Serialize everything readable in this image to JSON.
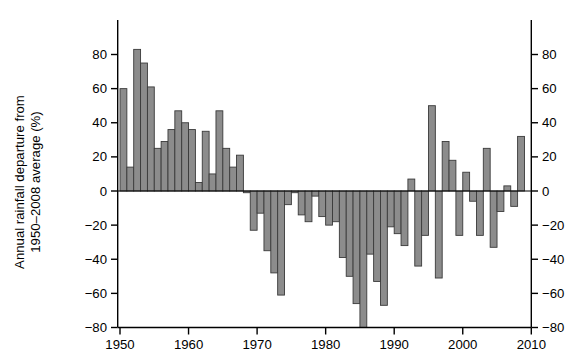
{
  "chart_data": {
    "type": "bar",
    "title": "",
    "xlabel": "",
    "ylabel": "Annual rainfall departure from\n1950–2008 average (%)",
    "ylim": [
      -80,
      90
    ],
    "xlim": [
      1949,
      2011
    ],
    "grid": false,
    "legend": null,
    "y_ticks": [
      80,
      60,
      40,
      20,
      0,
      -20,
      -40,
      -60,
      -80
    ],
    "y_tick_labels": [
      "80",
      "60",
      "40",
      "20",
      "0",
      "−20",
      "−40",
      "−60",
      "−80"
    ],
    "y_ticks_right": [
      80,
      60,
      40,
      20,
      0,
      -20,
      -40,
      -60,
      -80
    ],
    "y_tick_labels_right": [
      "80",
      "60",
      "40",
      "20",
      "0",
      "−20",
      "−40",
      "−60",
      "−80"
    ],
    "x_ticks": [
      1950,
      1960,
      1970,
      1980,
      1990,
      2000,
      2010
    ],
    "x_tick_labels": [
      "1950",
      "1960",
      "1970",
      "1980",
      "1990",
      "2000",
      "2010"
    ],
    "bar_color": "#8c8c8c",
    "bar_edge_color": "#3a3a3a",
    "axis_color": "#000000",
    "categories": [
      1950,
      1951,
      1952,
      1953,
      1954,
      1955,
      1956,
      1957,
      1958,
      1959,
      1960,
      1961,
      1962,
      1963,
      1964,
      1965,
      1966,
      1967,
      1968,
      1969,
      1970,
      1971,
      1972,
      1973,
      1974,
      1975,
      1976,
      1977,
      1978,
      1979,
      1980,
      1981,
      1982,
      1983,
      1984,
      1985,
      1986,
      1987,
      1988,
      1989,
      1990,
      1991,
      1992,
      1993,
      1994,
      1995,
      1996,
      1997,
      1998,
      1999,
      2000,
      2001,
      2002,
      2003,
      2004,
      2005,
      2006,
      2007,
      2008
    ],
    "values": [
      60,
      14,
      83,
      75,
      61,
      25,
      29,
      36,
      47,
      40,
      36,
      5,
      35,
      10,
      47,
      25,
      14,
      21,
      -1,
      -23,
      -13,
      -35,
      -48,
      -61,
      -8,
      -1,
      -14,
      -18,
      -3,
      -15,
      -20,
      -18,
      -39,
      -50,
      -66,
      -80,
      -37,
      -53,
      -67,
      -21,
      -25,
      -32,
      7,
      -44,
      -26,
      50,
      -51,
      29,
      18,
      -26,
      11,
      -6,
      -26,
      25,
      -33,
      -12,
      3,
      -9,
      32
    ]
  }
}
